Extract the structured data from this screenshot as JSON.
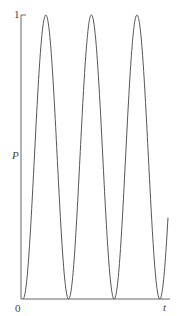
{
  "chart_data": {
    "type": "line",
    "title": "",
    "xlabel": "t",
    "ylabel": "P",
    "xlim": [
      0,
      1
    ],
    "ylim": [
      0,
      1
    ],
    "x_tick_labels": [
      "0",
      "t"
    ],
    "y_tick_labels": [
      "1"
    ],
    "grid": false,
    "legend": null,
    "series": [
      {
        "name": "P(t)",
        "function": "sin^2",
        "description": "Oscillating probability between 0 and 1, about 3.2 periods",
        "cycles": 3.18,
        "x": [
          0,
          0.16,
          0.32,
          0.48,
          0.64,
          0.79,
          0.95,
          1.0
        ],
        "y": [
          0,
          1,
          0,
          1,
          0,
          1,
          0,
          0.3
        ]
      }
    ],
    "color": "#555555"
  },
  "labels": {
    "y_top": "1",
    "y_axis": "P",
    "x_origin": "0",
    "x_axis": "t"
  }
}
